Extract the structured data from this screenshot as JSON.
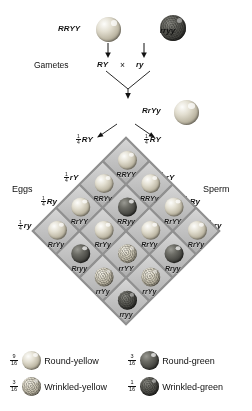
{
  "figure": {
    "parents": {
      "p1_genotype": "RRYY",
      "p1_seed": "round-yellow-seed-icon",
      "p2_genotype": "rryy",
      "p2_seed": "wrinkled-green-seed-icon"
    },
    "gametes": {
      "row_label": "Gametes",
      "left": "RY",
      "cross_symbol": "×",
      "right": "ry"
    },
    "f1": {
      "genotype": "RrYy",
      "seed": "round-yellow-seed-icon"
    },
    "f1_gametes_top": [
      {
        "num": "1",
        "den": "4",
        "allele": "RY"
      },
      {
        "num": "1",
        "den": "4",
        "allele": "RY"
      }
    ],
    "axis_labels": {
      "left": "Eggs",
      "right": "Sperm"
    },
    "eggs_gametes": [
      {
        "num": "1",
        "den": "4",
        "allele": "rY"
      },
      {
        "num": "1",
        "den": "4",
        "allele": "Ry"
      },
      {
        "num": "1",
        "den": "4",
        "allele": "ry"
      }
    ],
    "sperm_gametes": [
      {
        "num": "1",
        "den": "4",
        "allele": "rY"
      },
      {
        "num": "1",
        "den": "4",
        "allele": "Ry"
      },
      {
        "num": "1",
        "den": "4",
        "allele": "ry"
      }
    ]
  },
  "punnett": {
    "rows": [
      [
        {
          "genotype": "RRYY",
          "seed": "round-yellow"
        },
        {
          "genotype": "RRYy",
          "seed": "round-yellow"
        },
        {
          "genotype": "RrYY",
          "seed": "round-yellow"
        },
        {
          "genotype": "RrYy",
          "seed": "round-yellow"
        }
      ],
      [
        {
          "genotype": "RRYy",
          "seed": "round-yellow"
        },
        {
          "genotype": "RRyy",
          "seed": "round-green"
        },
        {
          "genotype": "RrYy",
          "seed": "round-yellow"
        },
        {
          "genotype": "Rryy",
          "seed": "round-green"
        }
      ],
      [
        {
          "genotype": "RrYY",
          "seed": "round-yellow"
        },
        {
          "genotype": "RrYy",
          "seed": "round-yellow"
        },
        {
          "genotype": "rrYY",
          "seed": "wrinkled-yellow"
        },
        {
          "genotype": "rrYy",
          "seed": "wrinkled-yellow"
        }
      ],
      [
        {
          "genotype": "RrYy",
          "seed": "round-yellow"
        },
        {
          "genotype": "Rryy",
          "seed": "round-green"
        },
        {
          "genotype": "rrYy",
          "seed": "wrinkled-yellow"
        },
        {
          "genotype": "rryy",
          "seed": "wrinkled-green"
        }
      ]
    ]
  },
  "legend": {
    "items": [
      {
        "num": "9",
        "den": "16",
        "seed": "round-yellow",
        "label": "Round-yellow"
      },
      {
        "num": "3",
        "den": "16",
        "seed": "round-green",
        "label": "Round-green"
      },
      {
        "num": "3",
        "den": "16",
        "seed": "wrinkled-yellow",
        "label": "Wrinkled-yellow"
      },
      {
        "num": "1",
        "den": "16",
        "seed": "wrinkled-green",
        "label": "Wrinkled-green"
      }
    ]
  }
}
